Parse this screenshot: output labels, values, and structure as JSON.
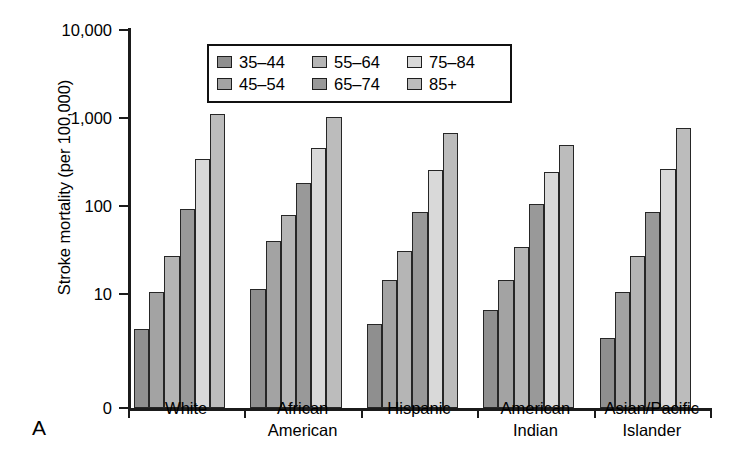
{
  "panel_label": "A",
  "chart_data": {
    "type": "bar",
    "title": "",
    "xlabel": "",
    "ylabel": "Stroke mortality (per 100,000)",
    "yscale": "log",
    "ylim": [
      2.2,
      10000
    ],
    "ytick_labels": [
      "10,000",
      "1,000",
      "100",
      "10",
      "0"
    ],
    "ytick_values": [
      10000,
      1000,
      100,
      10,
      0
    ],
    "grid": false,
    "legend_position": "upper-center-inside",
    "categories": [
      "White",
      "African American",
      "Hispanic",
      "American Indian",
      "Asian/Pacific Islander"
    ],
    "category_lines": [
      [
        "White"
      ],
      [
        "African",
        "American"
      ],
      [
        "Hispanic"
      ],
      [
        "American",
        "Indian"
      ],
      [
        "Asian/Pacific",
        "Islander"
      ]
    ],
    "series": [
      {
        "name": "35-44",
        "color": "#8f8f8f",
        "values": [
          4,
          11.5,
          4.6,
          6.5,
          3.2
        ]
      },
      {
        "name": "45-54",
        "color": "#a3a3a3",
        "values": [
          10.5,
          40,
          14.5,
          14.5,
          10.5
        ]
      },
      {
        "name": "55-64",
        "color": "#b5b5b5",
        "values": [
          27,
          80,
          31,
          34,
          27
        ]
      },
      {
        "name": "65-74",
        "color": "#999999",
        "values": [
          92,
          185,
          86,
          105,
          86
        ]
      },
      {
        "name": "75-84",
        "color": "#d9d9d9",
        "values": [
          340,
          460,
          255,
          245,
          265
        ]
      },
      {
        "name": "85+",
        "color": "#bcbcbc",
        "values": [
          1100,
          1020,
          670,
          500,
          780
        ]
      }
    ],
    "legend_rows": [
      [
        "35-44",
        "55-64",
        "75-84"
      ],
      [
        "45-54",
        "65-74",
        "85+"
      ]
    ],
    "legend_entries": [
      {
        "label": "35–44",
        "color": "#8f8f8f"
      },
      {
        "label": "55–64",
        "color": "#b5b5b5"
      },
      {
        "label": "75–84",
        "color": "#d9d9d9"
      },
      {
        "label": "45–54",
        "color": "#a3a3a3"
      },
      {
        "label": "65–74",
        "color": "#999999"
      },
      {
        "label": "85+",
        "color": "#bcbcbc"
      }
    ]
  }
}
